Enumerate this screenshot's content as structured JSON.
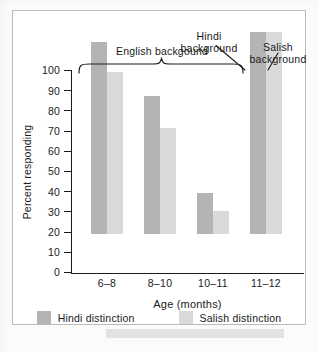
{
  "figure": {
    "annotations": [
      {
        "name": "english-background",
        "text": "English backgound"
      },
      {
        "name": "hindi-background",
        "text": "Hindi\nbackground"
      },
      {
        "name": "salish-background",
        "text": "Salish\nbackground"
      }
    ]
  },
  "legend": {
    "items": [
      {
        "label": "Hindi distinction",
        "color": "#b4b4b4"
      },
      {
        "label": "Salish distinction",
        "color": "#d9d9d9"
      }
    ]
  },
  "chart_data": {
    "type": "bar",
    "title": "",
    "xlabel": "Age (months)",
    "ylabel": "Percent responding",
    "categories": [
      "6–8",
      "8–10",
      "10–11",
      "11–12"
    ],
    "series": [
      {
        "name": "Hindi distinction",
        "color": "#b4b4b4",
        "values": [
          95,
          68,
          20,
          100
        ]
      },
      {
        "name": "Salish distinction",
        "color": "#d9d9d9",
        "values": [
          80,
          52,
          11,
          100
        ]
      }
    ],
    "ylim": [
      0,
      100
    ],
    "yticks": [
      0,
      10,
      20,
      30,
      40,
      50,
      60,
      70,
      80,
      90,
      100
    ],
    "grid": false,
    "legend_position": "bottom",
    "annotations": [
      {
        "text": "English backgound",
        "covers": [
          "6–8",
          "8–10",
          "10–11"
        ],
        "style": "curly-brace"
      },
      {
        "text": "Hindi background",
        "points_to": "11–12 / Hindi distinction",
        "style": "leader-line"
      },
      {
        "text": "Salish background",
        "points_to": "11–12 / Salish distinction",
        "style": "leader-line"
      }
    ]
  }
}
